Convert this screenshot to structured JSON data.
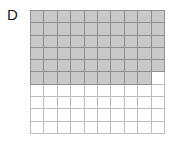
{
  "figure": {
    "label": "D",
    "label_name": "panel-label-d"
  },
  "colors": {
    "shaded_fill": "#c9c9c9",
    "shaded_gridline": "#8f8f8f",
    "empty_fill": "#ffffff",
    "empty_gridline": "#bdbdbd",
    "outer_border": "#8a8a8a",
    "label_text": "#1a1a1a",
    "background": "#ffffff"
  },
  "chart_data": {
    "type": "heatmap",
    "title": "D",
    "xlabel": "",
    "ylabel": "",
    "rows": 10,
    "columns": 10,
    "total_cells": 100,
    "shaded_cells": 59,
    "fraction": "59/100",
    "decimal": 0.59,
    "percent": 59,
    "grid": [
      [
        1,
        1,
        1,
        1,
        1,
        1,
        1,
        1,
        1,
        1
      ],
      [
        1,
        1,
        1,
        1,
        1,
        1,
        1,
        1,
        1,
        1
      ],
      [
        1,
        1,
        1,
        1,
        1,
        1,
        1,
        1,
        1,
        1
      ],
      [
        1,
        1,
        1,
        1,
        1,
        1,
        1,
        1,
        1,
        1
      ],
      [
        1,
        1,
        1,
        1,
        1,
        1,
        1,
        1,
        1,
        1
      ],
      [
        1,
        1,
        1,
        1,
        1,
        1,
        1,
        1,
        1,
        0
      ],
      [
        0,
        0,
        0,
        0,
        0,
        0,
        0,
        0,
        0,
        0
      ],
      [
        0,
        0,
        0,
        0,
        0,
        0,
        0,
        0,
        0,
        0
      ],
      [
        0,
        0,
        0,
        0,
        0,
        0,
        0,
        0,
        0,
        0
      ],
      [
        0,
        0,
        0,
        0,
        0,
        0,
        0,
        0,
        0,
        0
      ]
    ],
    "legend": [
      {
        "key": 1,
        "name": "shaded",
        "color": "#c9c9c9"
      },
      {
        "key": 0,
        "name": "unshaded",
        "color": "#ffffff"
      }
    ],
    "grid_on": true,
    "legend_position": "none"
  }
}
